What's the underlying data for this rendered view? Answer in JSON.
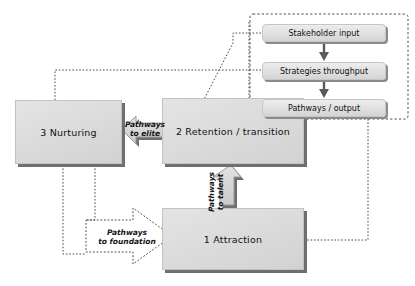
{
  "diagram": {
    "colors": {
      "box_fill": "#dcdcdc",
      "box_border": "#c2c2c2",
      "shadow": "#6f6f6f",
      "arrow_fill": "#d5d5d5",
      "arrow_stroke": "#8d8d8d",
      "dotted_line": "#4a4a4a",
      "background": "#ffffff"
    },
    "stages": [
      {
        "id": "nurturing",
        "label": "3  Nurturing"
      },
      {
        "id": "retention",
        "label": "2  Retention / transition"
      },
      {
        "id": "attraction",
        "label": "1  Attraction"
      }
    ],
    "process_chain": [
      {
        "id": "stakeholder",
        "label": "Stakeholder input"
      },
      {
        "id": "strategies",
        "label": "Strategies throughput"
      },
      {
        "id": "pathways",
        "label": "Pathways / output"
      }
    ],
    "pathways": [
      {
        "id": "elite",
        "line1": "Pathways",
        "line2": "to elite",
        "direction": "left"
      },
      {
        "id": "foundation",
        "line1": "Pathways",
        "line2": "to foundation",
        "direction": "right"
      },
      {
        "id": "talent",
        "line1": "Pathways",
        "line2": "to talent",
        "direction": "up"
      }
    ]
  }
}
